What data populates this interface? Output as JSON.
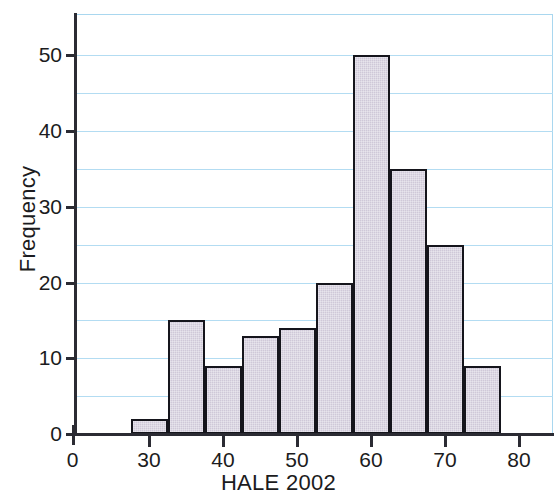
{
  "chart_data": {
    "type": "bar",
    "title": "",
    "subtitle": "",
    "xlabel": "HALE 2002",
    "ylabel": "Frequency",
    "grid": true,
    "legend": null,
    "legend_position": "none",
    "xlim": [
      27.5,
      82.5
    ],
    "ylim": [
      0,
      54
    ],
    "xticks": [
      0,
      30,
      40,
      50,
      60,
      70,
      80
    ],
    "xtick_labels": [
      "0",
      "30",
      "40",
      "50",
      "60",
      "70",
      "80"
    ],
    "yticks": [
      0,
      10,
      20,
      30,
      40,
      50
    ],
    "ytick_labels": [
      "0",
      "10",
      "20",
      "30",
      "40",
      "50"
    ],
    "gridline_values": [
      5,
      10,
      15,
      20,
      25,
      30,
      35,
      40,
      45,
      50
    ],
    "bin_width": 5,
    "bin_edges": [
      27.5,
      32.5,
      37.5,
      42.5,
      47.5,
      52.5,
      57.5,
      62.5,
      67.5,
      72.5,
      77.5
    ],
    "categories": [
      "27.5-32.5",
      "32.5-37.5",
      "37.5-42.5",
      "42.5-47.5",
      "47.5-52.5",
      "52.5-57.5",
      "57.5-62.5",
      "62.5-67.5",
      "67.5-72.5",
      "72.5-77.5"
    ],
    "values": [
      2,
      15,
      9,
      13,
      14,
      20,
      50,
      35,
      25,
      9
    ],
    "bar_fill_color": "#cfc8d8",
    "bar_edge_color": "#15151c",
    "grid_color": "#b3dcf2",
    "axis_color": "#2b2b33",
    "background_color": "#ffffff"
  }
}
